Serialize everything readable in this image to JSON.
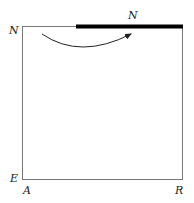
{
  "diagram": {
    "labels": {
      "top_left": "N",
      "top_bar": "N",
      "bottom_left_side": "E",
      "bottom_left": "A",
      "bottom_right": "R"
    },
    "colors": {
      "frame": "#777777",
      "bar": "#000000",
      "arrow": "#222222"
    }
  }
}
